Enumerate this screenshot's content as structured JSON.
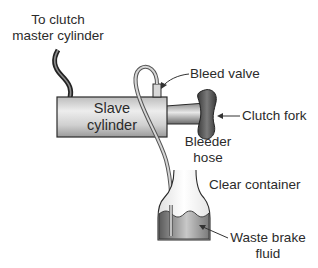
{
  "diagram": {
    "labels": {
      "master_cylinder": [
        "To clutch",
        "master cylinder"
      ],
      "slave_cylinder": [
        "Slave",
        "cylinder"
      ],
      "bleed_valve": "Bleed valve",
      "clutch_fork": "Clutch fork",
      "bleeder_hose": [
        "Bleeder",
        "hose"
      ],
      "clear_container": "Clear container",
      "waste_fluid": [
        "Waste brake",
        "fluid"
      ]
    },
    "caption_partial": "(caption cropped; illegible)",
    "colors": {
      "outline": "#2a2a2a",
      "cylinder_light": "#e6e6e6",
      "cylinder_dark": "#8c8c8c",
      "fork": "#555555",
      "fluid_dark": "#6e6e6e",
      "fluid_light": "#cfcfcf",
      "hose": "#9a9a9a"
    }
  }
}
